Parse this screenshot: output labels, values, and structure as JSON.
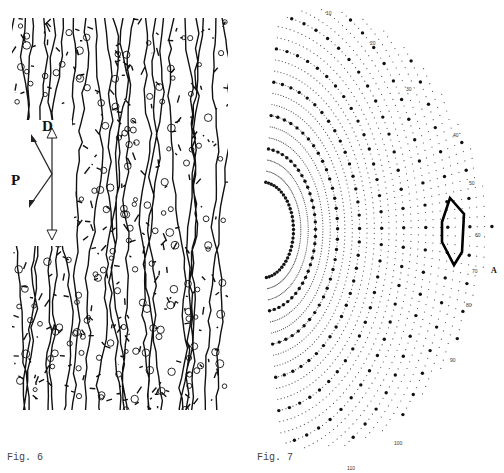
{
  "figures": [
    {
      "id": "fig6",
      "caption": "Fig. 6",
      "description": "Dense pen drawing of elongated interlocking cells/scales",
      "orientation_labels": {
        "dorsal": "D",
        "posterior": "P"
      },
      "arrows": [
        "double-headed vertical arrow (D axis)",
        "V-shaped arrow pair pointing left (P)"
      ]
    },
    {
      "id": "fig7",
      "caption": "Fig. 7",
      "description": "Fan-shaped grid of dots (large and small) arranged in curved rows, with a lens-shaped outlined region",
      "edge_ticks": [
        "10",
        "20",
        "30",
        "40",
        "50",
        "60",
        "70",
        "80",
        "90",
        "100",
        "110"
      ],
      "marker_label": "A",
      "dot_colors": {
        "large": "#111111",
        "small": "#555555"
      },
      "outline_color": "#000000"
    }
  ]
}
